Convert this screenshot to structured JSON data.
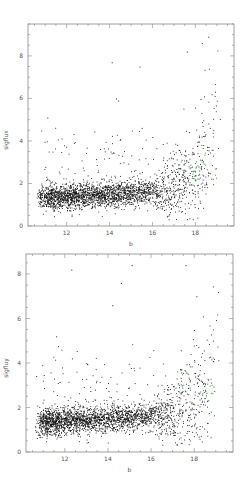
{
  "chart_data": [
    {
      "type": "scatter",
      "panel": "top",
      "xlabel": "b",
      "ylabel": "sigflux",
      "xlim": [
        10.2,
        19.8
      ],
      "ylim": [
        0,
        9.5
      ],
      "xticks": [
        12,
        14,
        16,
        18
      ],
      "yticks": [
        0,
        2,
        4,
        6,
        8
      ],
      "grid": false,
      "legend": null,
      "frame_px": {
        "left": 28,
        "top": 24,
        "right": 234,
        "bottom": 226
      },
      "series": [
        {
          "name": "stars",
          "color": "#111111",
          "n_points": 2600,
          "description": "sigma flux vs b magnitude; baseline ~1-2 at b 11-16, rising steeply to 4-9 near b 18-19"
        },
        {
          "name": "highlighted-green",
          "color": "#55aa55",
          "n_points": 25
        },
        {
          "name": "highlighted-purple",
          "color": "#7755bb",
          "n_points": 12
        }
      ],
      "outliers": [
        [
          11.1,
          5.1
        ],
        [
          14.1,
          7.7
        ],
        [
          14.3,
          6.0
        ],
        [
          14.4,
          5.9
        ],
        [
          17.6,
          8.2
        ],
        [
          18.3,
          8.6
        ],
        [
          18.6,
          8.9
        ],
        [
          15.4,
          7.5
        ]
      ]
    },
    {
      "type": "scatter",
      "panel": "bottom",
      "xlabel": "b",
      "ylabel": "sigfluy",
      "xlim": [
        10.2,
        19.8
      ],
      "ylim": [
        0,
        8.9
      ],
      "xticks": [
        12,
        14,
        16,
        18
      ],
      "yticks": [
        0,
        2,
        4,
        6,
        8
      ],
      "grid": false,
      "legend": null,
      "frame_px": {
        "left": 26,
        "top": 254,
        "right": 233,
        "bottom": 452
      },
      "series": [
        {
          "name": "stars",
          "color": "#111111",
          "n_points": 2600,
          "description": "sigma flux vs b magnitude; baseline ~1-2 at b 11-16, rising steeply to 4-8 near b 18-19"
        },
        {
          "name": "highlighted-green",
          "color": "#55aa55",
          "n_points": 25
        },
        {
          "name": "highlighted-purple",
          "color": "#7755bb",
          "n_points": 12
        }
      ],
      "outliers": [
        [
          12.3,
          8.2
        ],
        [
          14.6,
          7.6
        ],
        [
          14.2,
          6.6
        ],
        [
          11.6,
          5.2
        ],
        [
          15.1,
          8.4
        ],
        [
          17.6,
          8.4
        ],
        [
          18.1,
          7.0
        ],
        [
          14.0,
          3.1
        ],
        [
          11.5,
          3.3
        ]
      ]
    }
  ]
}
